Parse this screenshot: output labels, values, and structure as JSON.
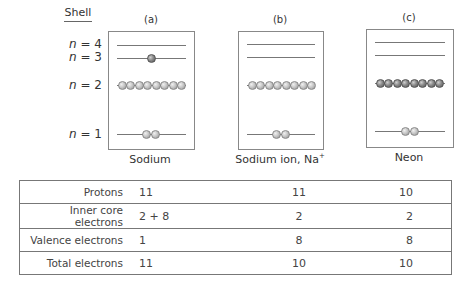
{
  "shell_header": "Shell",
  "shell_labels": [
    {
      "n": "n",
      "eq": " = ",
      "value": "4"
    },
    {
      "n": "n",
      "eq": " = ",
      "value": "3"
    },
    {
      "n": "n",
      "eq": " = ",
      "value": "2"
    },
    {
      "n": "n",
      "eq": " = ",
      "value": "1"
    }
  ],
  "panels": [
    {
      "letter": "(a)",
      "caption": "Sodium",
      "caption_sup": "",
      "shells": {
        "n4": 0,
        "n3": 1,
        "n2": 8,
        "n1": 2
      },
      "n3_color": "dark",
      "n2_color": "light"
    },
    {
      "letter": "(b)",
      "caption": "Sodium ion, Na",
      "caption_sup": "+",
      "shells": {
        "n4": 0,
        "n3": 0,
        "n2": 8,
        "n1": 2
      },
      "n2_color": "light"
    },
    {
      "letter": "(c)",
      "caption": "Neon",
      "caption_sup": "",
      "shells": {
        "n4": 0,
        "n3": 0,
        "n2": 8,
        "n1": 2
      },
      "n2_color": "dark"
    }
  ],
  "table": {
    "rows": [
      {
        "label": "Protons",
        "a": "11",
        "b": "11",
        "c": "10"
      },
      {
        "label": "Inner core electrons",
        "a": "2 + 8",
        "b": "2",
        "c": "2"
      },
      {
        "label": "Valence electrons",
        "a": "1",
        "b": "8",
        "c": "8"
      },
      {
        "label": "Total electrons",
        "a": "11",
        "b": "10",
        "c": "10"
      }
    ]
  },
  "colors": {
    "line": "#777777",
    "sphere_light": "#c8c8c8",
    "sphere_dark": "#7a7a7a",
    "border": "#888888"
  }
}
